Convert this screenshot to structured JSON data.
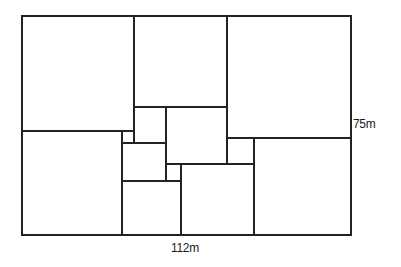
{
  "diagram": {
    "type": "squared-rectangle",
    "stroke_color": "#222222",
    "background": "#ffffff",
    "labels": {
      "height": "75m",
      "width": "112m"
    },
    "outer": {
      "x1": 22,
      "y1": 16,
      "x2": 351,
      "y2": 235
    },
    "lines": [
      {
        "id": "v134",
        "x1": 134,
        "y1": 16,
        "x2": 134,
        "y2": 143
      },
      {
        "id": "v227",
        "x1": 227,
        "y1": 16,
        "x2": 227,
        "y2": 164
      },
      {
        "id": "h131",
        "x1": 22,
        "y1": 131,
        "x2": 134,
        "y2": 131
      },
      {
        "id": "h107",
        "x1": 134,
        "y1": 107,
        "x2": 227,
        "y2": 107
      },
      {
        "id": "h138",
        "x1": 227,
        "y1": 138,
        "x2": 351,
        "y2": 138
      },
      {
        "id": "v122",
        "x1": 122,
        "y1": 131,
        "x2": 122,
        "y2": 235
      },
      {
        "id": "h143",
        "x1": 122,
        "y1": 143,
        "x2": 166,
        "y2": 143
      },
      {
        "id": "v166",
        "x1": 166,
        "y1": 107,
        "x2": 166,
        "y2": 181
      },
      {
        "id": "h164",
        "x1": 166,
        "y1": 164,
        "x2": 254,
        "y2": 164
      },
      {
        "id": "h181",
        "x1": 122,
        "y1": 181,
        "x2": 181,
        "y2": 181
      },
      {
        "id": "v181",
        "x1": 181,
        "y1": 164,
        "x2": 181,
        "y2": 235
      },
      {
        "id": "v254",
        "x1": 254,
        "y1": 138,
        "x2": 254,
        "y2": 235
      }
    ]
  }
}
